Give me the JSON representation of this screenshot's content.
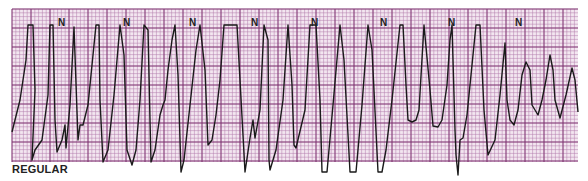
{
  "strip": {
    "label": "REGULAR",
    "grid": {
      "left": 12,
      "top": 9,
      "right": 578,
      "bottom": 162,
      "small": 3.8,
      "large": 19
    },
    "colors": {
      "paper": "#f3e6f0",
      "minor_line": "#b27aaa",
      "major_line": "#7a2f6e",
      "trace": "#1a1a1a"
    },
    "n_markers": [
      {
        "label": "N",
        "x": 58,
        "y": 23
      },
      {
        "label": "N",
        "x": 123,
        "y": 23
      },
      {
        "label": "N",
        "x": 189,
        "y": 23
      },
      {
        "label": "N",
        "x": 251,
        "y": 23
      },
      {
        "label": "N",
        "x": 311,
        "y": 23
      },
      {
        "label": "N",
        "x": 380,
        "y": 23
      },
      {
        "label": "N",
        "x": 448,
        "y": 23
      },
      {
        "label": "N",
        "x": 515,
        "y": 23
      }
    ],
    "trace_points": [
      [
        12,
        132
      ],
      [
        20,
        100
      ],
      [
        26,
        60
      ],
      [
        28,
        25
      ],
      [
        33,
        25
      ],
      [
        35,
        90
      ],
      [
        32,
        160
      ],
      [
        35,
        150
      ],
      [
        42,
        140
      ],
      [
        48,
        95
      ],
      [
        50,
        25
      ],
      [
        53,
        25
      ],
      [
        55,
        120
      ],
      [
        57,
        152
      ],
      [
        62,
        140
      ],
      [
        65,
        125
      ],
      [
        66,
        148
      ],
      [
        70,
        105
      ],
      [
        74,
        27
      ],
      [
        78,
        140
      ],
      [
        80,
        125
      ],
      [
        83,
        125
      ],
      [
        88,
        105
      ],
      [
        96,
        25
      ],
      [
        99,
        25
      ],
      [
        100,
        100
      ],
      [
        103,
        162
      ],
      [
        108,
        150
      ],
      [
        114,
        95
      ],
      [
        120,
        25
      ],
      [
        124,
        55
      ],
      [
        127,
        150
      ],
      [
        132,
        165
      ],
      [
        136,
        150
      ],
      [
        140,
        100
      ],
      [
        144,
        25
      ],
      [
        148,
        30
      ],
      [
        150,
        120
      ],
      [
        151,
        162
      ],
      [
        155,
        150
      ],
      [
        160,
        115
      ],
      [
        163,
        105
      ],
      [
        165,
        100
      ],
      [
        168,
        70
      ],
      [
        172,
        40
      ],
      [
        175,
        25
      ],
      [
        178,
        75
      ],
      [
        181,
        172
      ],
      [
        184,
        160
      ],
      [
        190,
        105
      ],
      [
        196,
        50
      ],
      [
        200,
        25
      ],
      [
        205,
        70
      ],
      [
        208,
        145
      ],
      [
        212,
        140
      ],
      [
        216,
        115
      ],
      [
        220,
        80
      ],
      [
        224,
        25
      ],
      [
        237,
        25
      ],
      [
        240,
        80
      ],
      [
        245,
        172
      ],
      [
        250,
        138
      ],
      [
        253,
        120
      ],
      [
        255,
        138
      ],
      [
        260,
        110
      ],
      [
        264,
        25
      ],
      [
        268,
        40
      ],
      [
        269,
        160
      ],
      [
        270,
        170
      ],
      [
        276,
        150
      ],
      [
        283,
        100
      ],
      [
        288,
        25
      ],
      [
        292,
        85
      ],
      [
        294,
        145
      ],
      [
        296,
        148
      ],
      [
        305,
        110
      ],
      [
        310,
        25
      ],
      [
        316,
        25
      ],
      [
        320,
        100
      ],
      [
        322,
        172
      ],
      [
        327,
        172
      ],
      [
        333,
        105
      ],
      [
        340,
        25
      ],
      [
        344,
        60
      ],
      [
        350,
        172
      ],
      [
        356,
        172
      ],
      [
        362,
        105
      ],
      [
        368,
        25
      ],
      [
        372,
        50
      ],
      [
        378,
        172
      ],
      [
        382,
        172
      ],
      [
        386,
        150
      ],
      [
        392,
        100
      ],
      [
        400,
        25
      ],
      [
        403,
        25
      ],
      [
        406,
        85
      ],
      [
        408,
        120
      ],
      [
        412,
        122
      ],
      [
        416,
        120
      ],
      [
        419,
        110
      ],
      [
        424,
        25
      ],
      [
        430,
        90
      ],
      [
        433,
        126
      ],
      [
        438,
        127
      ],
      [
        442,
        120
      ],
      [
        447,
        85
      ],
      [
        450,
        40
      ],
      [
        452,
        25
      ],
      [
        455,
        130
      ],
      [
        456,
        155
      ],
      [
        458,
        175
      ],
      [
        460,
        140
      ],
      [
        463,
        138
      ],
      [
        467,
        115
      ],
      [
        473,
        55
      ],
      [
        476,
        25
      ],
      [
        480,
        25
      ],
      [
        484,
        110
      ],
      [
        488,
        155
      ],
      [
        495,
        140
      ],
      [
        500,
        95
      ],
      [
        505,
        43
      ],
      [
        507,
        100
      ],
      [
        510,
        120
      ],
      [
        514,
        125
      ],
      [
        518,
        110
      ],
      [
        522,
        75
      ],
      [
        526,
        62
      ],
      [
        530,
        70
      ],
      [
        532,
        105
      ],
      [
        535,
        110
      ],
      [
        538,
        115
      ],
      [
        542,
        100
      ],
      [
        546,
        80
      ],
      [
        550,
        55
      ],
      [
        553,
        70
      ],
      [
        555,
        100
      ],
      [
        560,
        118
      ],
      [
        566,
        95
      ],
      [
        572,
        68
      ],
      [
        575,
        80
      ],
      [
        578,
        112
      ]
    ]
  }
}
